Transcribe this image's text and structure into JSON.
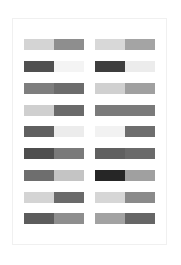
{
  "rows": [
    {
      "left": [
        "#d4d4d4",
        "#8e8e8e"
      ],
      "right": [
        "#d8d8d8",
        "#a4a4a4"
      ]
    },
    {
      "left": [
        "#505050",
        "#f4f4f4"
      ],
      "right": [
        "#3e3e3e",
        "#ececec"
      ]
    },
    {
      "left": [
        "#7e7e7e",
        "#6c6c6c"
      ],
      "right": [
        "#d0d0d0",
        "#a0a0a0"
      ]
    },
    {
      "left": [
        "#cfcfcf",
        "#6a6a6a"
      ],
      "right": [
        "#7a7a7a",
        "#7a7a7a"
      ]
    },
    {
      "left": [
        "#606060",
        "#ececec"
      ],
      "right": [
        "#f2f2f2",
        "#6e6e6e"
      ]
    },
    {
      "left": [
        "#4e4e4e",
        "#7a7a7a"
      ],
      "right": [
        "#606060",
        "#6a6a6a"
      ]
    },
    {
      "left": [
        "#6e6e6e",
        "#c4c4c4"
      ],
      "right": [
        "#262626",
        "#a0a0a0"
      ]
    },
    {
      "left": [
        "#d4d4d4",
        "#6a6a6a"
      ],
      "right": [
        "#d6d6d6",
        "#8a8a8a"
      ]
    },
    {
      "left": [
        "#5c5c5c",
        "#8e8e8e"
      ],
      "right": [
        "#a2a2a2",
        "#666666"
      ]
    }
  ]
}
